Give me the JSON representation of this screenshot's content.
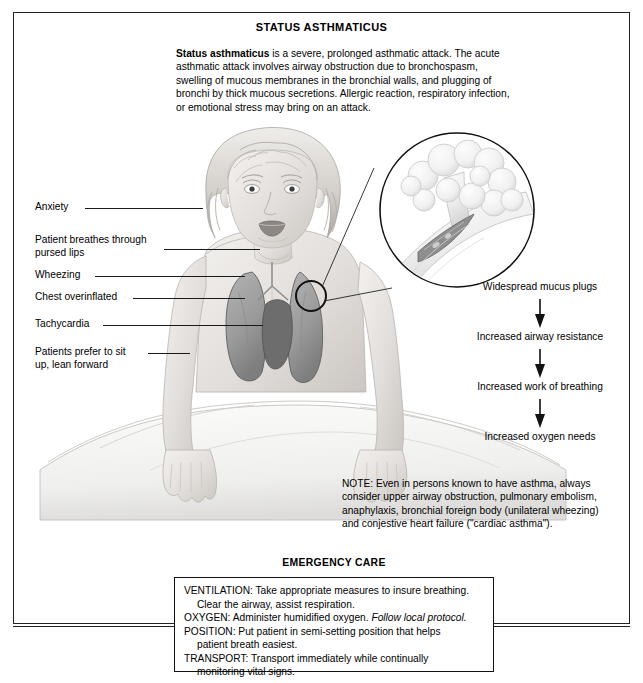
{
  "document": {
    "title": "STATUS ASTHMATICUS"
  },
  "intro": {
    "lead": "Status asthmaticus",
    "body": " is a severe, prolonged asthmatic attack. The acute asthmatic attack involves airway obstruction due to bronchospasm, swelling of mucous membranes in the bronchial walls, and plugging of bronchi by thick mucous secretions. Allergic reaction, respiratory infection, or emotional stress may bring on an attack."
  },
  "signs": {
    "items": [
      {
        "label": "Anxiety"
      },
      {
        "label": "Patient breathes through\npursed lips"
      },
      {
        "label": "Wheezing"
      },
      {
        "label": "Chest overinflated"
      },
      {
        "label": "Tachycardia"
      },
      {
        "label": "Patients prefer to sit\nup, lean forward"
      }
    ]
  },
  "pathway": {
    "steps": [
      "Widespread mucus plugs",
      "Increased airway resistance",
      "Increased work of breathing",
      "Increased oxygen needs"
    ]
  },
  "note": {
    "text": "NOTE: Even in persons known to have asthma, always consider upper airway obstruction, pulmonary embolism, anaphylaxis, bronchial foreign body (unilateral wheezing) and conjestive heart failure (\"cardiac asthma\")."
  },
  "emergency_care": {
    "heading": "EMERGENCY CARE",
    "lines": [
      {
        "text": "VENTILATION: Take appropriate measures to insure breathing.",
        "indent": false
      },
      {
        "text": "Clear the airway, assist respiration.",
        "indent": true
      },
      {
        "text": "OXYGEN: Administer humidified oxygen. ",
        "indent": false,
        "italic": "Follow local protocol."
      },
      {
        "text": "POSITION: Put patient in semi-setting position that helps",
        "indent": false
      },
      {
        "text": "patient breath easiest.",
        "indent": true
      },
      {
        "text": "TRANSPORT: Transport immediately while continually",
        "indent": false
      },
      {
        "text": "monitoring vital signs.",
        "indent": true
      }
    ]
  },
  "illustration": {
    "patient_figure": "seated-child-with-lungs-and-heart-overlay",
    "inset": "magnified-bronchiole-with-alveoli-and-mucus-plug",
    "callout_marker": "circled-bronchiole-site-on-chest"
  },
  "colors": {
    "ink": "#000000",
    "rule": "#222222",
    "skin": "#e9e6e2",
    "skin_shade": "#d2cdc8",
    "lung": "#9b9b9b",
    "heart": "#6f6f6f",
    "sheet": "#f2f2f0",
    "hair": "#cfcbc6"
  }
}
